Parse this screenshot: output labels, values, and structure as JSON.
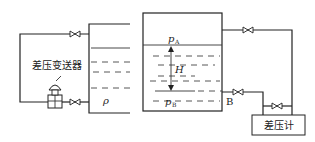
{
  "diagram": {
    "left_figure": {
      "transmitter_label": "差压变送器",
      "density_label": "ρ",
      "components": [
        "open-tank",
        "upper-valve",
        "lower-valve",
        "dp-transmitter"
      ]
    },
    "right_figure": {
      "top_pressure": {
        "symbol": "p",
        "subscript": "A"
      },
      "bottom_pressure": {
        "symbol": "p",
        "subscript": "B"
      },
      "height_label": "H",
      "point_label": "B",
      "gauge_label": "差压计",
      "components": [
        "closed-tank",
        "upper-valve",
        "lower-valve",
        "balance-valve",
        "dp-gauge"
      ]
    }
  }
}
